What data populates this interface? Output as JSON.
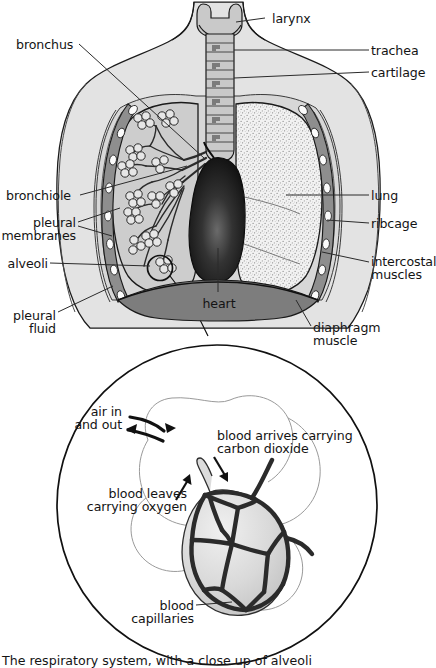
{
  "figure": {
    "title": "The respiratory system, with a close up of alveoli",
    "caption": "The respiratory system, with a close up of alveoli"
  },
  "colors": {
    "ink": "#141414",
    "outline": "#1a1a1a",
    "body_fill": "#e3e3e3",
    "thorax_fill": "#d2d2d2",
    "lung_left_fill": "#cfcfcf",
    "lung_right_fill": "#efefef",
    "rib_fill": "#8e8e8e",
    "rib_highlight": "#fbfbfb",
    "heart_fill": "#1d1d1d",
    "diaphragm_fill": "#7d7d7d",
    "alveolus_fill": "#dcdcdc",
    "capillary": "#2b2b2b",
    "leader": "#2b2b2b"
  },
  "upper_diagram": {
    "name": "respiratory-system-overview",
    "labels": [
      {
        "id": "larynx",
        "text": "larynx",
        "align": "left",
        "x": 272,
        "y": 12
      },
      {
        "id": "trachea",
        "text": "trachea",
        "align": "left",
        "x": 371,
        "y": 44
      },
      {
        "id": "cartilage",
        "text": "cartilage",
        "align": "left",
        "x": 371,
        "y": 66
      },
      {
        "id": "bronchus",
        "text": "bronchus",
        "align": "left",
        "x": 16,
        "y": 38
      },
      {
        "id": "bronchiole",
        "text": "bronchiole",
        "align": "left",
        "x": 6,
        "y": 189
      },
      {
        "id": "pleural-membranes",
        "text": "pleural\nmembranes",
        "align": "right",
        "x": 6,
        "y": 216
      },
      {
        "id": "alveoli",
        "text": "alveoli",
        "align": "right",
        "x": 6,
        "y": 257
      },
      {
        "id": "pleural-fluid",
        "text": "pleural\nfluid",
        "align": "right",
        "x": 6,
        "y": 309
      },
      {
        "id": "lung",
        "text": "lung",
        "align": "left",
        "x": 371,
        "y": 189
      },
      {
        "id": "ribcage",
        "text": "ribcage",
        "align": "left",
        "x": 371,
        "y": 217
      },
      {
        "id": "intercostal-muscles",
        "text": "intercostal\nmuscles",
        "align": "left",
        "x": 371,
        "y": 255
      },
      {
        "id": "heart",
        "text": "heart",
        "align": "center",
        "x": 201,
        "y": 297
      },
      {
        "id": "diaphragm-muscle",
        "text": "diaphragm\nmuscle",
        "align": "left",
        "x": 313,
        "y": 321
      }
    ]
  },
  "closeup_diagram": {
    "name": "alveoli-closeup",
    "labels": [
      {
        "id": "air-in-and-out",
        "text": "air in\nand out",
        "align": "right",
        "x": 40,
        "y": 405
      },
      {
        "id": "blood-arrives-carrying-carbon-dioxide",
        "text": "blood arrives carrying\ncarbon dioxide",
        "align": "left",
        "x": 217,
        "y": 429
      },
      {
        "id": "blood-leaves-carrying-oxygen",
        "text": "blood leaves\ncarrying oxygen",
        "align": "right",
        "x": 42,
        "y": 487
      },
      {
        "id": "blood-capillaries",
        "text": "blood\ncapillaries",
        "align": "right",
        "x": 60,
        "y": 599
      }
    ]
  }
}
